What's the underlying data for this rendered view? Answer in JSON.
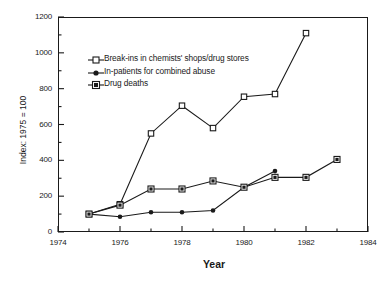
{
  "chart_data": {
    "type": "line",
    "title": "",
    "xlabel": "Year",
    "ylabel": "Index: 1975 = 100",
    "xlim": [
      1974,
      1984
    ],
    "ylim": [
      0,
      1200
    ],
    "xticks": [
      1974,
      1976,
      1978,
      1980,
      1982,
      1984
    ],
    "xticks_minor": [
      1975,
      1977,
      1979,
      1981,
      1983
    ],
    "yticks": [
      0,
      200,
      400,
      600,
      800,
      1000,
      1200
    ],
    "yticks_minor": [
      100,
      300,
      500,
      700,
      900,
      1100
    ],
    "grid": false,
    "legend_position": "upper-left-inside",
    "series": [
      {
        "name": "Break-ins in chemists' shops/drug stores",
        "marker": "open-square",
        "x": [
          1975,
          1976,
          1977,
          1978,
          1979,
          1980,
          1981,
          1982
        ],
        "values": [
          100,
          155,
          550,
          705,
          580,
          755,
          770,
          1110
        ]
      },
      {
        "name": "In-patients for combined abuse",
        "marker": "filled-dot",
        "x": [
          1975,
          1976,
          1977,
          1978,
          1979,
          1980,
          1981
        ],
        "values": [
          100,
          85,
          110,
          110,
          120,
          250,
          340
        ]
      },
      {
        "name": "Drug deaths",
        "marker": "filled-square",
        "x": [
          1975,
          1976,
          1977,
          1978,
          1979,
          1980,
          1981,
          1982,
          1983
        ],
        "values": [
          100,
          150,
          240,
          240,
          285,
          250,
          305,
          305,
          405
        ]
      }
    ]
  },
  "axis": {
    "ytick_labels": [
      "0",
      "200",
      "400",
      "600",
      "800",
      "1000",
      "1200"
    ],
    "xtick_labels": [
      "1974",
      "1976",
      "1978",
      "1980",
      "1982",
      "1984"
    ],
    "x_title": "Year",
    "y_title": "Index: 1975 = 100"
  },
  "legend": {
    "items": [
      {
        "label": "Break-ins in chemists' shops/drug stores"
      },
      {
        "label": "In-patients for combined abuse"
      },
      {
        "label": "Drug deaths"
      }
    ]
  },
  "colors": {
    "line": "#1a1a1a",
    "marker_fill_open": "#ffffff",
    "marker_fill_solid": "#1a1a1a",
    "background": "#ffffff"
  }
}
